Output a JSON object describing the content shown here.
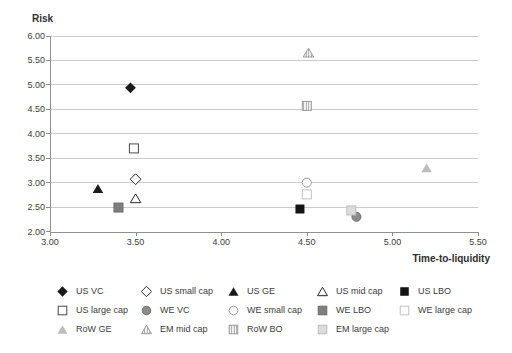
{
  "chart": {
    "y_title": "Risk",
    "x_title": "Time-to-liquidity"
  },
  "chart_data": {
    "type": "scatter",
    "title": "",
    "xlabel": "Time-to-liquidity",
    "ylabel": "Risk",
    "xlim": [
      3.0,
      5.5
    ],
    "ylim": [
      2.0,
      6.0
    ],
    "x_ticks": [
      "3.00",
      "3.50",
      "4.00",
      "4.50",
      "5.00",
      "5.50"
    ],
    "y_ticks": [
      "6.00",
      "5.50",
      "5.00",
      "4.50",
      "4.00",
      "3.50",
      "3.00",
      "2.50",
      "2.00"
    ],
    "grid": "horizontal",
    "legend_position": "bottom",
    "series": [
      {
        "name": "US VC",
        "x": 3.47,
        "y": 4.94,
        "shape": "diamond",
        "fill": "#1a1a1a",
        "stroke": "none"
      },
      {
        "name": "US small cap",
        "x": 3.5,
        "y": 3.07,
        "shape": "diamond",
        "fill": "#ffffff",
        "stroke": "#2b2b2b"
      },
      {
        "name": "US GE",
        "x": 3.28,
        "y": 2.88,
        "shape": "triangle",
        "fill": "#1a1a1a",
        "stroke": "none"
      },
      {
        "name": "US mid cap",
        "x": 3.5,
        "y": 2.68,
        "shape": "triangle",
        "fill": "#ffffff",
        "stroke": "#2b2b2b"
      },
      {
        "name": "US LBO",
        "x": 4.46,
        "y": 2.46,
        "shape": "square",
        "fill": "#141414",
        "stroke": "none"
      },
      {
        "name": "US large cap",
        "x": 3.49,
        "y": 3.7,
        "shape": "square",
        "fill": "#ffffff",
        "stroke": "#4a4a4a"
      },
      {
        "name": "WE VC",
        "x": 4.79,
        "y": 2.3,
        "shape": "circle",
        "fill": "#8b8b8b",
        "stroke": "#6f6f6f"
      },
      {
        "name": "WE small cap",
        "x": 4.5,
        "y": 3.0,
        "shape": "circle",
        "fill": "#ffffff",
        "stroke": "#9a9a9a"
      },
      {
        "name": "WE LBO",
        "x": 3.4,
        "y": 2.49,
        "shape": "square",
        "fill": "#7f7f7f",
        "stroke": "#6b6b6b"
      },
      {
        "name": "WE large cap",
        "x": 4.5,
        "y": 2.76,
        "shape": "square",
        "fill": "#ffffff",
        "stroke": "#c2c2c2"
      },
      {
        "name": "RoW GE",
        "x": 5.2,
        "y": 3.3,
        "shape": "triangle",
        "fill": "#bdbdbd",
        "stroke": "none"
      },
      {
        "name": "EM mid cap",
        "x": 4.51,
        "y": 5.66,
        "shape": "triangle",
        "fill": "hatch",
        "stroke": "#9a9a9a"
      },
      {
        "name": "RoW BO",
        "x": 4.5,
        "y": 4.57,
        "shape": "square",
        "fill": "hatch",
        "stroke": "#9a9a9a"
      },
      {
        "name": "EM large cap",
        "x": 4.76,
        "y": 2.43,
        "shape": "square",
        "fill": "#dcdcdc",
        "stroke": "#bdbdbd"
      }
    ],
    "legend_rows": [
      [
        0,
        1,
        2,
        3,
        4
      ],
      [
        5,
        6,
        7,
        8,
        9
      ],
      [
        10,
        11,
        12,
        13
      ]
    ]
  },
  "colors": {
    "gridline": "#cbcbcb",
    "axis": "#8f8f8f",
    "tick_text": "#3c3c3c",
    "title_text": "#2e2e2e",
    "hatch_line": "#8f8f8f",
    "background": "#ffffff"
  }
}
